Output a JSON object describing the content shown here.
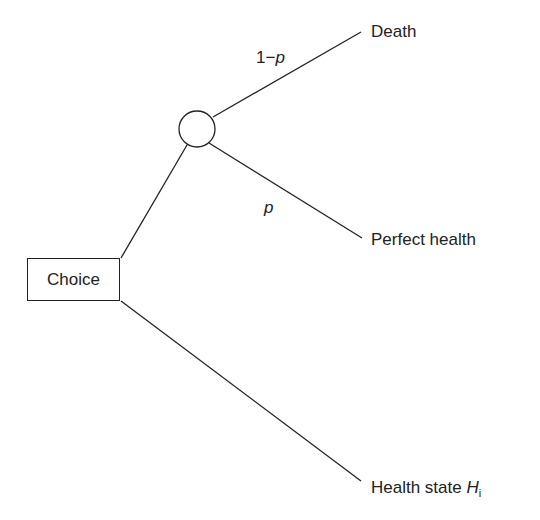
{
  "diagram": {
    "type": "decision-tree",
    "decision_node": {
      "label": "Choice"
    },
    "chance_node": {
      "label": ""
    },
    "branches": [
      {
        "from": "chance",
        "probability_prefix": "1−",
        "probability_var": "p",
        "outcome": "Death"
      },
      {
        "from": "chance",
        "probability_prefix": "",
        "probability_var": "p",
        "outcome": "Perfect health"
      },
      {
        "from": "decision",
        "outcome_prefix": "Health state ",
        "outcome_var": "H",
        "outcome_sub": "i"
      }
    ],
    "colors": {
      "line": "#222222",
      "background": "#ffffff"
    }
  }
}
